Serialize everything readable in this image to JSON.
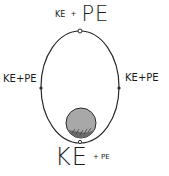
{
  "diagram": {
    "labels": {
      "top": {
        "small": "KE",
        "plus": "+",
        "large": "PE"
      },
      "left": "KE+PE",
      "right": "KE+PE",
      "bottom": {
        "large": "KE",
        "small": "+ PE"
      }
    },
    "colors": {
      "stroke": "#2a2a2a",
      "ball_fill": "#a8a8a8",
      "ball_shadow": "#6a6a6a",
      "background": "#ffffff"
    }
  }
}
